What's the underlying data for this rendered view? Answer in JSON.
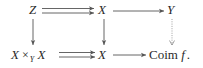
{
  "diagram": {
    "type": "commutative-diagram",
    "nodes": {
      "top_left": {
        "label": "Z"
      },
      "top_middle": {
        "label": "X"
      },
      "top_right": {
        "label": "Y"
      },
      "bottom_left": {
        "left": "X",
        "op": "×",
        "sub": "Y",
        "right": "X"
      },
      "bottom_middle": {
        "label": "X"
      },
      "bottom_right": {
        "prefix": "Coim",
        "var": "f",
        "punct": "."
      }
    },
    "edges": [
      {
        "from": "Z",
        "to": "X",
        "style": "double-parallel-arrow",
        "position": "top-left"
      },
      {
        "from": "X",
        "to": "Y",
        "style": "solid-arrow",
        "position": "top-right"
      },
      {
        "from": "Z",
        "to": "X ×_Y X",
        "style": "solid-arrow",
        "position": "left-vertical"
      },
      {
        "from": "X",
        "to": "X",
        "style": "solid-arrow",
        "position": "middle-vertical"
      },
      {
        "from": "Y",
        "to": "Coim f",
        "style": "dotted-arrow",
        "position": "right-vertical"
      },
      {
        "from": "X ×_Y X",
        "to": "X",
        "style": "double-parallel-arrow",
        "position": "bottom-left"
      },
      {
        "from": "X",
        "to": "Coim f",
        "style": "solid-arrow",
        "position": "bottom-right"
      }
    ],
    "colors": {
      "ink": "#2a2a2a",
      "arrow": "#555555",
      "dotted": "#888888"
    }
  }
}
